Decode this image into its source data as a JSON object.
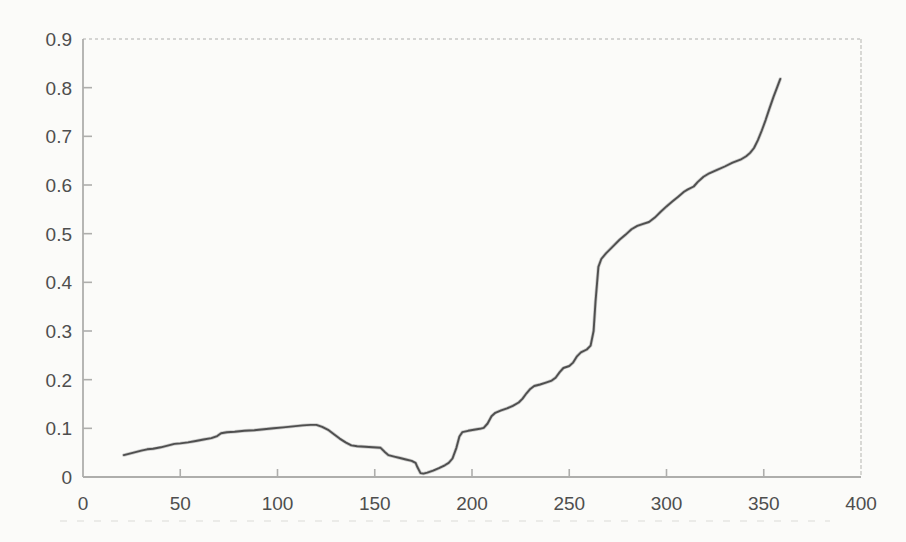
{
  "figure": {
    "kind": "scanned-excel-style-line-chart",
    "title": "",
    "legend": "none"
  },
  "colors": {
    "line": "#4f4f4f",
    "line_halo": "#9a9a9a",
    "axis": "#aeaeac",
    "frame": "#c9c9c6",
    "tick_labels": "#4e4e4e",
    "background": "#fbfbf9",
    "scan_artifact": "#e2e2dd"
  },
  "chart_data": {
    "type": "line",
    "title": "",
    "xlabel": "",
    "ylabel": "",
    "xlim": [
      0,
      400
    ],
    "ylim": [
      0,
      0.9
    ],
    "grid": "top and right frame lines only (faint, dotted); no interior gridlines",
    "legend_position": "none",
    "x_ticks": [
      {
        "value": 0,
        "label": "0"
      },
      {
        "value": 50,
        "label": "50"
      },
      {
        "value": 100,
        "label": "100"
      },
      {
        "value": 150,
        "label": "150"
      },
      {
        "value": 200,
        "label": "200"
      },
      {
        "value": 250,
        "label": "250"
      },
      {
        "value": 300,
        "label": "300"
      },
      {
        "value": 350,
        "label": "350"
      },
      {
        "value": 400,
        "label": "400"
      }
    ],
    "y_ticks": [
      {
        "value": 0,
        "label": "0"
      },
      {
        "value": 0.1,
        "label": "0.1"
      },
      {
        "value": 0.2,
        "label": "0.2"
      },
      {
        "value": 0.3,
        "label": "0.3"
      },
      {
        "value": 0.4,
        "label": "0.4"
      },
      {
        "value": 0.5,
        "label": "0.5"
      },
      {
        "value": 0.6,
        "label": "0.6"
      },
      {
        "value": 0.7,
        "label": "0.7"
      },
      {
        "value": 0.8,
        "label": "0.8"
      },
      {
        "value": 0.9,
        "label": "0.9"
      }
    ],
    "series": [
      {
        "name": "series-1",
        "color": "#4f4f4f",
        "points": [
          [
            21,
            0.045
          ],
          [
            24,
            0.048
          ],
          [
            27,
            0.051
          ],
          [
            30,
            0.054
          ],
          [
            33,
            0.057
          ],
          [
            36,
            0.058
          ],
          [
            40,
            0.061
          ],
          [
            44,
            0.065
          ],
          [
            47,
            0.068
          ],
          [
            50,
            0.069
          ],
          [
            54,
            0.071
          ],
          [
            58,
            0.074
          ],
          [
            62,
            0.077
          ],
          [
            66,
            0.08
          ],
          [
            69,
            0.084
          ],
          [
            71,
            0.09
          ],
          [
            74,
            0.092
          ],
          [
            78,
            0.093
          ],
          [
            83,
            0.095
          ],
          [
            88,
            0.096
          ],
          [
            93,
            0.098
          ],
          [
            98,
            0.1
          ],
          [
            103,
            0.102
          ],
          [
            108,
            0.104
          ],
          [
            113,
            0.106
          ],
          [
            117,
            0.107
          ],
          [
            120,
            0.107
          ],
          [
            123,
            0.103
          ],
          [
            126,
            0.097
          ],
          [
            129,
            0.088
          ],
          [
            132,
            0.079
          ],
          [
            135,
            0.071
          ],
          [
            138,
            0.065
          ],
          [
            141,
            0.063
          ],
          [
            145,
            0.062
          ],
          [
            149,
            0.061
          ],
          [
            153,
            0.06
          ],
          [
            155,
            0.052
          ],
          [
            157,
            0.045
          ],
          [
            160,
            0.042
          ],
          [
            163,
            0.039
          ],
          [
            166,
            0.036
          ],
          [
            169,
            0.033
          ],
          [
            171,
            0.029
          ],
          [
            172,
            0.02
          ],
          [
            173.5,
            0.008
          ],
          [
            175,
            0.007
          ],
          [
            177,
            0.009
          ],
          [
            180,
            0.013
          ],
          [
            183,
            0.018
          ],
          [
            186,
            0.024
          ],
          [
            188,
            0.029
          ],
          [
            190,
            0.038
          ],
          [
            192,
            0.06
          ],
          [
            193.5,
            0.083
          ],
          [
            195,
            0.092
          ],
          [
            198,
            0.095
          ],
          [
            201,
            0.097
          ],
          [
            204,
            0.099
          ],
          [
            206,
            0.101
          ],
          [
            208,
            0.11
          ],
          [
            210,
            0.125
          ],
          [
            212,
            0.132
          ],
          [
            215,
            0.137
          ],
          [
            218,
            0.141
          ],
          [
            221,
            0.146
          ],
          [
            224,
            0.153
          ],
          [
            226,
            0.161
          ],
          [
            228,
            0.172
          ],
          [
            230,
            0.181
          ],
          [
            232,
            0.187
          ],
          [
            235,
            0.19
          ],
          [
            238,
            0.194
          ],
          [
            241,
            0.198
          ],
          [
            243,
            0.204
          ],
          [
            245,
            0.215
          ],
          [
            247,
            0.224
          ],
          [
            250,
            0.228
          ],
          [
            252,
            0.235
          ],
          [
            254,
            0.248
          ],
          [
            256,
            0.256
          ],
          [
            259,
            0.262
          ],
          [
            261,
            0.27
          ],
          [
            262.5,
            0.3
          ],
          [
            263.5,
            0.36
          ],
          [
            265,
            0.432
          ],
          [
            266.5,
            0.448
          ],
          [
            269,
            0.46
          ],
          [
            272,
            0.472
          ],
          [
            276,
            0.488
          ],
          [
            279,
            0.498
          ],
          [
            282,
            0.509
          ],
          [
            285,
            0.516
          ],
          [
            288,
            0.52
          ],
          [
            291,
            0.524
          ],
          [
            294,
            0.533
          ],
          [
            297,
            0.545
          ],
          [
            300,
            0.556
          ],
          [
            303,
            0.566
          ],
          [
            306,
            0.576
          ],
          [
            309,
            0.586
          ],
          [
            311,
            0.591
          ],
          [
            314,
            0.597
          ],
          [
            316,
            0.606
          ],
          [
            319,
            0.617
          ],
          [
            322,
            0.624
          ],
          [
            326,
            0.631
          ],
          [
            330,
            0.638
          ],
          [
            334,
            0.646
          ],
          [
            338,
            0.652
          ],
          [
            341,
            0.659
          ],
          [
            343,
            0.666
          ],
          [
            345,
            0.676
          ],
          [
            347,
            0.692
          ],
          [
            349,
            0.712
          ],
          [
            351,
            0.734
          ],
          [
            353,
            0.758
          ],
          [
            355,
            0.781
          ],
          [
            357,
            0.802
          ],
          [
            358.5,
            0.818
          ]
        ]
      }
    ]
  }
}
